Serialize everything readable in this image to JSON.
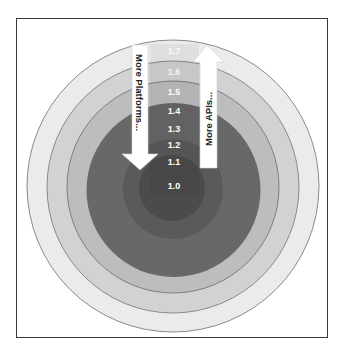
{
  "diagram": {
    "type": "concentric-rings",
    "rings": [
      {
        "label": "1.7",
        "color": "#ebebeb",
        "r": 146
      },
      {
        "label": "1.6",
        "color": "#d2d2d2",
        "r": 126
      },
      {
        "label": "1.5",
        "color": "#bdbdbd",
        "r": 106
      },
      {
        "label": "1.4",
        "color": "#686868",
        "r": 87
      },
      {
        "label": "1.3",
        "color": "#686868",
        "r": 87
      },
      {
        "label": "1.2",
        "color": "#575757",
        "r": 50
      },
      {
        "label": "1.1",
        "color": "#575757",
        "r": 50
      },
      {
        "label": "1.0",
        "color": "#494949",
        "r": 33
      }
    ],
    "labels": {
      "v17": "1.7",
      "v16": "1.6",
      "v15": "1.5",
      "v14": "1.4",
      "v13": "1.3",
      "v12": "1.2",
      "v11": "1.1",
      "v10": "1.0"
    },
    "arrows": {
      "down": {
        "text": "More Platforms...",
        "direction": "down"
      },
      "up": {
        "text": "More APIs...",
        "direction": "up"
      }
    },
    "colors": {
      "ring_outline": "#8a8a8a",
      "label_text": "#ffffff",
      "arrow_fill": "#ffffff",
      "arrow_text": "#222222",
      "frame_border": "#3a3a3a"
    }
  }
}
